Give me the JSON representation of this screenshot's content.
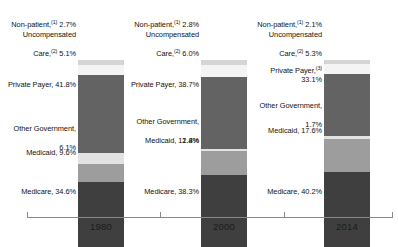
{
  "chart_data": {
    "type": "bar",
    "subtype": "stacked-bar-100pct",
    "title": "",
    "xlabel": "",
    "ylabel": "",
    "ylim": [
      0,
      100
    ],
    "grid": false,
    "legend": "none (direct segment labels)",
    "categories": [
      "1980",
      "2000",
      "2014"
    ],
    "series": [
      {
        "name": "Medicare",
        "values": [
          34.6,
          38.3,
          40.2
        ]
      },
      {
        "name": "Medicaid",
        "values": [
          9.6,
          12.8,
          17.6
        ]
      },
      {
        "name": "Other Government",
        "values": [
          6.1,
          1.4,
          1.7
        ]
      },
      {
        "name": "Private Payer",
        "values": [
          41.8,
          38.7,
          33.1
        ]
      },
      {
        "name": "Uncompensated Care",
        "values": [
          5.1,
          6.0,
          5.3
        ]
      },
      {
        "name": "Non-patient",
        "values": [
          2.7,
          2.8,
          2.1
        ]
      }
    ],
    "stack_order_bottom_to_top": [
      "Medicare",
      "Medicaid",
      "Other Government",
      "Private Payer",
      "Uncompensated Care",
      "Non-patient"
    ],
    "colors": {
      "Medicare": "#3f3f3f",
      "Medicaid": "#9d9d9d",
      "Other Government": "#e2e2e2",
      "Private Payer": "#636363",
      "Uncompensated Care": "#f4f4f4",
      "Non-patient": "#d5d5d5",
      "axis": "#8a8a8a",
      "text": "#111111"
    }
  },
  "axis": {
    "ticks": [
      "1980",
      "2000",
      "2014"
    ]
  },
  "labels": {
    "c1980": {
      "nonpatient": {
        "name": "Non-patient,",
        "sup": "(1)",
        "value": "2.7%"
      },
      "uncomp": {
        "line1": "Uncompensated",
        "name": "Care,",
        "sup": "(2)",
        "value": "5.1%"
      },
      "private": {
        "name": "Private Payer,",
        "sup": "",
        "value": "41.8%"
      },
      "othergov": {
        "line1": "Other Government,",
        "value": "6.1%"
      },
      "medicaid": {
        "name": "Medicaid,",
        "value": "9.6%"
      },
      "medicare": {
        "name": "Medicare,",
        "value": "34.6%"
      }
    },
    "c2000": {
      "nonpatient": {
        "name": "Non-patient,",
        "sup": "(1)",
        "value": "2.8%"
      },
      "uncomp": {
        "line1": "Uncompensated",
        "name": "Care,",
        "sup": "(2)",
        "value": "6.0%"
      },
      "private": {
        "name": "Private Payer,",
        "sup": "",
        "value": "38.7%"
      },
      "othergov": {
        "line1": "Other Government,",
        "value": "1.4%"
      },
      "medicaid": {
        "name": "Medicaid,",
        "value": "12.8%"
      },
      "medicare": {
        "name": "Medicare,",
        "value": "38.3%"
      }
    },
    "c2014": {
      "nonpatient": {
        "name": "Non-patient,",
        "sup": "(1)",
        "value": "2.1%"
      },
      "uncomp": {
        "line1": "Uncompensated",
        "name": "Care,",
        "sup": "(2)",
        "value": "5.3%"
      },
      "private": {
        "name": "Private Payer,",
        "sup": "(3)",
        "value": "33.1%"
      },
      "othergov": {
        "line1": "Other Government,",
        "value": "1.7%"
      },
      "medicaid": {
        "name": "Medicaid,",
        "value": "17.6%"
      },
      "medicare": {
        "name": "Medicare,",
        "value": "40.2%"
      }
    }
  }
}
